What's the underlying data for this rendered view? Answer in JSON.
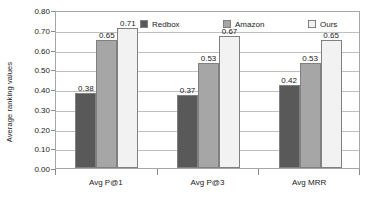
{
  "chart_data": {
    "type": "bar",
    "title": "",
    "subtitle": "",
    "xlabel": "",
    "ylabel": "Average ranking values",
    "ylim": [
      0.0,
      0.8
    ],
    "ytick_labels": [
      "0.80",
      "0.70",
      "0.60",
      "0.50",
      "0.40",
      "0.30",
      "0.20",
      "0.10",
      "0.00"
    ],
    "ytick_values": [
      0.8,
      0.7,
      0.6,
      0.5,
      0.4,
      0.3,
      0.2,
      0.1,
      0.0
    ],
    "grid": "horizontal",
    "legend_position": "top-inside",
    "categories": [
      "Avg P@1",
      "Avg P@3",
      "Avg MRR"
    ],
    "series": [
      {
        "name": "Redbox",
        "color": "#595959",
        "values": [
          0.38,
          0.37,
          0.42
        ],
        "value_labels": [
          "0.38",
          "0.37",
          "0.42"
        ]
      },
      {
        "name": "Amazon",
        "color": "#a6a6a6",
        "values": [
          0.65,
          0.53,
          0.53
        ],
        "value_labels": [
          "0.65",
          "0.53",
          "0.53"
        ]
      },
      {
        "name": "Ours",
        "color": "#f2f2f2",
        "values": [
          0.71,
          0.67,
          0.65
        ],
        "value_labels": [
          "0.71",
          "0.67",
          "0.65"
        ]
      }
    ]
  },
  "axis": {
    "y_title": "Average ranking values"
  },
  "colors": {
    "plot_border": "#a6a6a6",
    "gridline": "#bfbfbf",
    "bar_border": "#808080",
    "text": "#1a1a1a",
    "background": "#ffffff"
  }
}
